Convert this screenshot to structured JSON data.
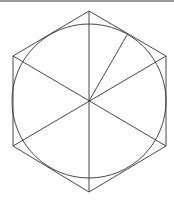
{
  "diagram": {
    "type": "geometry",
    "stroke_color": "#333333",
    "background": "#ffffff",
    "top_bar_color": "#9a9a9a",
    "center": [
      89,
      101
    ],
    "circle_radius": 77,
    "hexagon_vertices": [
      [
        89,
        11
      ],
      [
        166,
        56
      ],
      [
        166,
        146
      ],
      [
        89,
        192
      ],
      [
        13,
        146
      ],
      [
        13,
        56
      ]
    ],
    "extra_radius_end": [
      127,
      35
    ]
  }
}
